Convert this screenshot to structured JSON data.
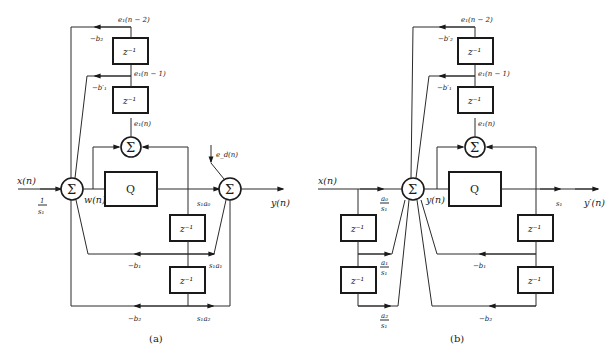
{
  "figure": {
    "diagram_a": {
      "caption": "(a)",
      "input_label": "x(n)",
      "input_gain_num": "1",
      "input_gain_den": "s₁",
      "sum_symbol": "Σ",
      "node_w": "w(n)",
      "quantizer": "Q",
      "error_sum_symbol": "Σ",
      "output_sum_symbol": "Σ",
      "error_input": "e_d(n)",
      "e1_n": "e₁(n)",
      "e1_n1": "e₁(n − 1)",
      "e1_n2": "e₁(n − 2)",
      "delay": "z⁻¹",
      "coef_b2_top": "−b₂",
      "coef_b1p_top": "−b′₁",
      "coef_s1a0": "s₁a₀",
      "coef_s1a1": "s₁a₁",
      "coef_s1a2": "s₁a₂",
      "coef_b1": "−b₁",
      "coef_b2": "−b₂",
      "output_label": "y(n)"
    },
    "diagram_b": {
      "caption": "(b)",
      "input_label": "x(n)",
      "sum_symbol": "Σ",
      "node_y": "y(n)",
      "quantizer": "Q",
      "error_sum_symbol": "Σ",
      "e1_n": "e₁(n)",
      "e1_n1": "e₁(n − 1)",
      "e1_n2": "e₁(n − 2)",
      "delay": "z⁻¹",
      "coef_b2p_top": "−b′₂",
      "coef_b1p_top": "−b′₁",
      "coef_a0_num": "a₀",
      "coef_a1_num": "a₁",
      "coef_a2_num": "a₂",
      "coef_den": "s₁",
      "coef_s1": "s₁",
      "coef_b1": "−b₁",
      "coef_b2": "−b₂",
      "output_label": "y′(n)"
    }
  }
}
